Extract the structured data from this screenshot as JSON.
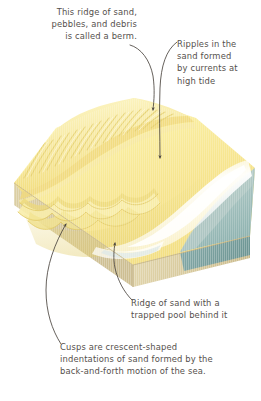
{
  "figure": {
    "annotations": [
      {
        "id": "berm",
        "text": "This ridge of sand,\npebbles, and debris\nis called a berm.",
        "points_to": "berm-crest"
      },
      {
        "id": "ripples",
        "text": "Ripples in the\nsand formed\nby currents at\nhigh tide",
        "points_to": "ripple-field"
      },
      {
        "id": "ridge-pool",
        "text": "Ridge of sand with a\ntrapped pool behind it",
        "points_to": "sand-ridge-pool"
      },
      {
        "id": "cusps",
        "text": "Cusps are crescent-shaped\nindentations of sand formed by the\nback-and-forth motion of the sea.",
        "points_to": "beach-cusps"
      }
    ],
    "colors": {
      "sand_light": "#fbf0a8",
      "sand_mid": "#f5e58b",
      "sand_deep": "#f0d86a",
      "sand_shadow": "#e8cd74",
      "substrate_tan": "#d6c79a",
      "substrate_tan_dark": "#c9b788",
      "sea_teal": "#a8c4c2",
      "sea_teal_dark": "#7fa8a6",
      "sea_edge": "#6f9b99",
      "surf_white": "#ffffff",
      "text": "#55504c",
      "arrow": "#4a453f",
      "background": "#ffffff"
    },
    "features": [
      "berm-crest",
      "ripple-field",
      "beach-cusps",
      "sand-ridge-pool",
      "surf-line",
      "sea"
    ]
  }
}
